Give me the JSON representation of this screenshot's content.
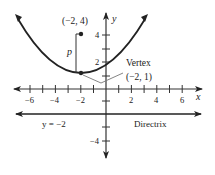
{
  "diagram": {
    "axes": {
      "x_label": "x",
      "y_label": "y",
      "x_ticks": [
        "−6",
        "−4",
        "−2",
        "2",
        "4",
        "6"
      ],
      "y_ticks": [
        "4",
        "2",
        "−4"
      ]
    },
    "focus": {
      "label": "(−2, 4)"
    },
    "vertex": {
      "title": "Vertex",
      "label": "(−2, 1)"
    },
    "distance_label": "p",
    "directrix": {
      "equation": "y = −2",
      "label": "Directrix"
    },
    "colors": {
      "curve": "#222222",
      "axis": "#333333",
      "callout": "#777777"
    }
  }
}
